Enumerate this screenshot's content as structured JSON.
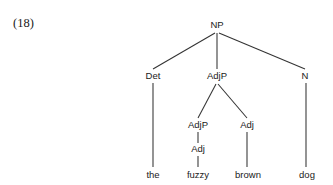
{
  "figure": {
    "example_number": "(18)",
    "line_color": "#333333",
    "text_color": "#1a1a1a",
    "background_color": "#ffffff"
  },
  "tree": {
    "root": "NP",
    "nodes": [
      {
        "id": "np",
        "label": "NP",
        "x": 217,
        "y": 28,
        "level": 0
      },
      {
        "id": "det",
        "label": "Det",
        "x": 153,
        "y": 79,
        "level": 1
      },
      {
        "id": "adjp1",
        "label": "AdjP",
        "x": 217,
        "y": 79,
        "level": 1
      },
      {
        "id": "n",
        "label": "N",
        "x": 305,
        "y": 79,
        "level": 1
      },
      {
        "id": "adjp2",
        "label": "AdjP",
        "x": 198,
        "y": 128,
        "level": 2
      },
      {
        "id": "adj1",
        "label": "Adj",
        "x": 247,
        "y": 128,
        "level": 2
      },
      {
        "id": "adj2",
        "label": "Adj",
        "x": 198,
        "y": 152,
        "level": 3
      }
    ],
    "leaves": [
      {
        "id": "leaf-the",
        "label": "the",
        "x": 153,
        "y": 178
      },
      {
        "id": "leaf-fuzzy",
        "label": "fuzzy",
        "x": 198,
        "y": 178
      },
      {
        "id": "leaf-brown",
        "label": "brown",
        "x": 248,
        "y": 178
      },
      {
        "id": "leaf-dog",
        "label": "dog",
        "x": 307,
        "y": 178
      }
    ],
    "edges": [
      {
        "id": "np-det",
        "from": "np",
        "to": "det",
        "x1": 215,
        "y1": 33,
        "x2": 153,
        "y2": 69
      },
      {
        "id": "np-adjp",
        "from": "np",
        "to": "adjp1",
        "x1": 217,
        "y1": 33,
        "x2": 217,
        "y2": 69
      },
      {
        "id": "np-n",
        "from": "np",
        "to": "n",
        "x1": 219,
        "y1": 33,
        "x2": 305,
        "y2": 69
      },
      {
        "id": "det-the",
        "from": "det",
        "to": "leaf-the",
        "x1": 153,
        "y1": 83,
        "x2": 153,
        "y2": 167
      },
      {
        "id": "adjp-adjp",
        "from": "adjp1",
        "to": "adjp2",
        "x1": 216,
        "y1": 84,
        "x2": 198,
        "y2": 118
      },
      {
        "id": "adjp-adj",
        "from": "adjp1",
        "to": "adj1",
        "x1": 218,
        "y1": 84,
        "x2": 247,
        "y2": 118
      },
      {
        "id": "adjp2-adj2",
        "from": "adjp2",
        "to": "adj2",
        "x1": 198,
        "y1": 132,
        "x2": 198,
        "y2": 143
      },
      {
        "id": "adj2-fuzzy",
        "from": "adj2",
        "to": "leaf-fuzzy",
        "x1": 198,
        "y1": 156,
        "x2": 198,
        "y2": 167
      },
      {
        "id": "adj1-brown",
        "from": "adj1",
        "to": "leaf-brown",
        "x1": 247,
        "y1": 132,
        "x2": 247,
        "y2": 167
      },
      {
        "id": "n-dog",
        "from": "n",
        "to": "leaf-dog",
        "x1": 306,
        "y1": 83,
        "x2": 306,
        "y2": 167
      }
    ],
    "sentence": "the fuzzy brown dog"
  }
}
